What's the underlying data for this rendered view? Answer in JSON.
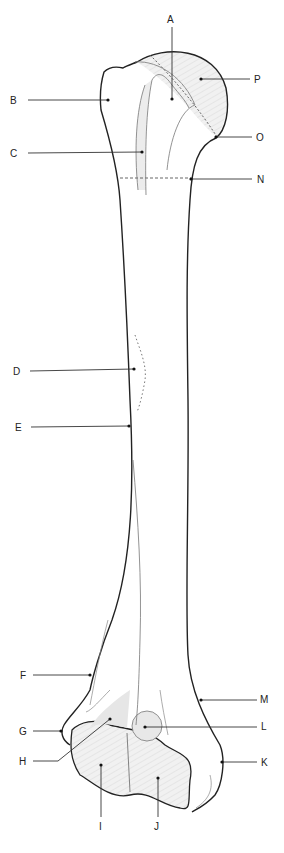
{
  "diagram": {
    "colors": {
      "outline": "#222222",
      "leader": "#333333",
      "shade": "#e6e6e6",
      "thin_line": "#777777"
    },
    "labels": [
      {
        "id": "A",
        "text": "A",
        "x": 167,
        "y": 15
      },
      {
        "id": "B",
        "text": "B",
        "x": 10,
        "y": 96
      },
      {
        "id": "C",
        "text": "C",
        "x": 10,
        "y": 149
      },
      {
        "id": "D",
        "text": "D",
        "x": 13,
        "y": 367
      },
      {
        "id": "E",
        "text": "E",
        "x": 15,
        "y": 424
      },
      {
        "id": "F",
        "text": "F",
        "x": 20,
        "y": 671
      },
      {
        "id": "G",
        "text": "G",
        "x": 19,
        "y": 726
      },
      {
        "id": "H",
        "text": "H",
        "x": 19,
        "y": 757
      },
      {
        "id": "I",
        "text": "I",
        "x": 99,
        "y": 826
      },
      {
        "id": "J",
        "text": "J",
        "x": 154,
        "y": 826
      },
      {
        "id": "K",
        "text": "K",
        "x": 261,
        "y": 757
      },
      {
        "id": "L",
        "text": "L",
        "x": 261,
        "y": 722
      },
      {
        "id": "M",
        "text": "M",
        "x": 260,
        "y": 695
      },
      {
        "id": "N",
        "text": "N",
        "x": 256,
        "y": 176
      },
      {
        "id": "O",
        "text": "O",
        "x": 256,
        "y": 134
      },
      {
        "id": "P",
        "text": "P",
        "x": 254,
        "y": 75
      }
    ]
  }
}
